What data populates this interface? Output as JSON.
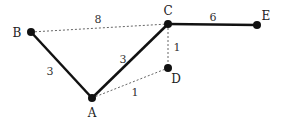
{
  "diagram": {
    "type": "weighted-graph",
    "nodes": [
      {
        "id": "A",
        "label": "A",
        "x": 92,
        "y": 98,
        "lx": 92,
        "ly": 117
      },
      {
        "id": "B",
        "label": "B",
        "x": 31,
        "y": 32,
        "lx": 17,
        "ly": 37
      },
      {
        "id": "C",
        "label": "C",
        "x": 168,
        "y": 24,
        "lx": 168,
        "ly": 15
      },
      {
        "id": "D",
        "label": "D",
        "x": 168,
        "y": 68,
        "lx": 176,
        "ly": 83
      },
      {
        "id": "E",
        "label": "E",
        "x": 257,
        "y": 25,
        "lx": 266,
        "ly": 20
      }
    ],
    "edges": [
      {
        "from": "B",
        "to": "A",
        "weight": "3",
        "style": "solid",
        "wx": 50,
        "wy": 75
      },
      {
        "from": "A",
        "to": "C",
        "weight": "3",
        "style": "solid",
        "wx": 123,
        "wy": 63
      },
      {
        "from": "C",
        "to": "E",
        "weight": "6",
        "style": "solid",
        "wx": 213,
        "wy": 21
      },
      {
        "from": "B",
        "to": "C",
        "weight": "8",
        "style": "dotted",
        "wx": 98,
        "wy": 23
      },
      {
        "from": "C",
        "to": "D",
        "weight": "1",
        "style": "dotted",
        "wx": 177,
        "wy": 51
      },
      {
        "from": "A",
        "to": "D",
        "weight": "1",
        "style": "dotted",
        "wx": 135,
        "wy": 96
      }
    ]
  }
}
